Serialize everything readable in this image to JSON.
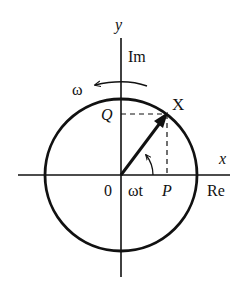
{
  "diagram": {
    "labels": {
      "y_axis": "y",
      "imag_axis": "Im",
      "x_axis": "x",
      "real_axis": "Re",
      "omega": "ω",
      "phasor": "X",
      "q_point": "Q",
      "p_point": "P",
      "origin": "0",
      "angle": "ωt"
    },
    "geometry": {
      "center": [
        121,
        175
      ],
      "radius": 76,
      "phasor_tip": [
        167,
        114
      ]
    },
    "colors": {
      "ink": "#111111",
      "background": "#ffffff"
    }
  }
}
